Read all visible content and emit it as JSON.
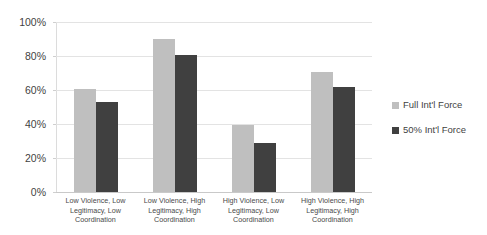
{
  "chart_data": {
    "type": "bar",
    "title": "",
    "xlabel": "",
    "ylabel": "",
    "ylim": [
      0,
      100
    ],
    "ytick_labels": [
      "100%",
      "80%",
      "60%",
      "40%",
      "20%",
      "0%"
    ],
    "ytick_values": [
      100,
      80,
      60,
      40,
      20,
      0
    ],
    "grid": true,
    "legend_position": "right",
    "categories": [
      "Low Violence, Low Legitimacy, Low Coordination",
      "Low Violence, High Legitimacy, High Coordination",
      "High Violence, Low Legitimacy, Low Coordination",
      "High Violence, High Legitimacy, High Coordination"
    ],
    "category_lines": [
      [
        "Low Violence, Low",
        "Legitimacy, Low",
        "Coordination"
      ],
      [
        "Low Violence, High",
        "Legitimacy, High",
        "Coordination"
      ],
      [
        "High Violence, Low",
        "Legitimacy, Low",
        "Coordination"
      ],
      [
        "High Violence, High",
        "Legitimacy, High",
        "Coordination"
      ]
    ],
    "series": [
      {
        "name": "Full Int'l Force",
        "color": "#bfbfbf",
        "values": [
          61,
          90,
          40,
          71
        ]
      },
      {
        "name": "50% Int'l Force",
        "color": "#404040",
        "values": [
          53,
          81,
          29,
          62
        ]
      }
    ]
  },
  "legend": {
    "items": [
      {
        "label": "Full Int'l Force"
      },
      {
        "label": "50% Int'l Force"
      }
    ]
  }
}
